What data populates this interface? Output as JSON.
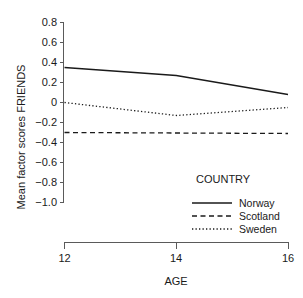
{
  "chart_data": {
    "type": "line",
    "title": "",
    "xlabel": "AGE",
    "ylabel": "Mean factor scores FRIENDS",
    "x": [
      12,
      14,
      16
    ],
    "xlim": [
      12,
      16
    ],
    "ylim": [
      -1.0,
      0.8
    ],
    "xticks": [
      "12",
      "14",
      "16"
    ],
    "yticks": [
      "0.8",
      "0.6",
      "0.4",
      "0.2",
      "0",
      "−0.2",
      "−0.4",
      "−0.6",
      "−0.8",
      "−1.0"
    ],
    "ytick_values": [
      0.8,
      0.6,
      0.4,
      0.2,
      0,
      -0.2,
      -0.4,
      -0.6,
      -0.8,
      -1.0
    ],
    "grid": false,
    "legend_position": "inside-lower-right",
    "legend_title": "COUNTRY",
    "series": [
      {
        "name": "Norway",
        "style": "solid",
        "color": "#1a1a1a",
        "values": [
          0.35,
          0.27,
          0.08
        ]
      },
      {
        "name": "Scotland",
        "style": "dashed",
        "color": "#1a1a1a",
        "values": [
          -0.3,
          -0.305,
          -0.31
        ]
      },
      {
        "name": "Sweden",
        "style": "dotted",
        "color": "#1a1a1a",
        "values": [
          0.0,
          -0.13,
          -0.05
        ]
      }
    ]
  },
  "axis": {
    "x_title": "AGE",
    "y_title": "Mean factor scores FRIENDS"
  },
  "legend": {
    "title": "COUNTRY",
    "entries": [
      {
        "label": "Norway",
        "style": "solid"
      },
      {
        "label": "Scotland",
        "style": "dashed"
      },
      {
        "label": "Sweden",
        "style": "dotted"
      }
    ]
  },
  "ticks": {
    "y": [
      "0.8",
      "0.6",
      "0.4",
      "0.2",
      "0",
      "−0.2",
      "−0.4",
      "−0.6",
      "−0.8",
      "−1.0"
    ],
    "x": [
      "12",
      "14",
      "16"
    ]
  }
}
